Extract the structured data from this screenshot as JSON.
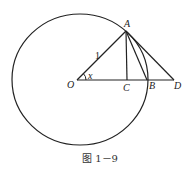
{
  "figure": {
    "caption": "图 1－9",
    "stroke_color": "#222222",
    "circle": {
      "cx": 80,
      "cy": 79.5,
      "rx": 68,
      "ry": 65.5
    },
    "points": {
      "O": {
        "label": "O",
        "x": 77,
        "y": 80
      },
      "A": {
        "label": "A",
        "x": 126,
        "y": 31
      },
      "C": {
        "label": "C",
        "x": 127,
        "y": 80
      },
      "B": {
        "label": "B",
        "x": 147,
        "y": 80
      },
      "D": {
        "label": "D",
        "x": 174,
        "y": 80
      }
    },
    "radius_label": "1",
    "angle_label": "x"
  }
}
